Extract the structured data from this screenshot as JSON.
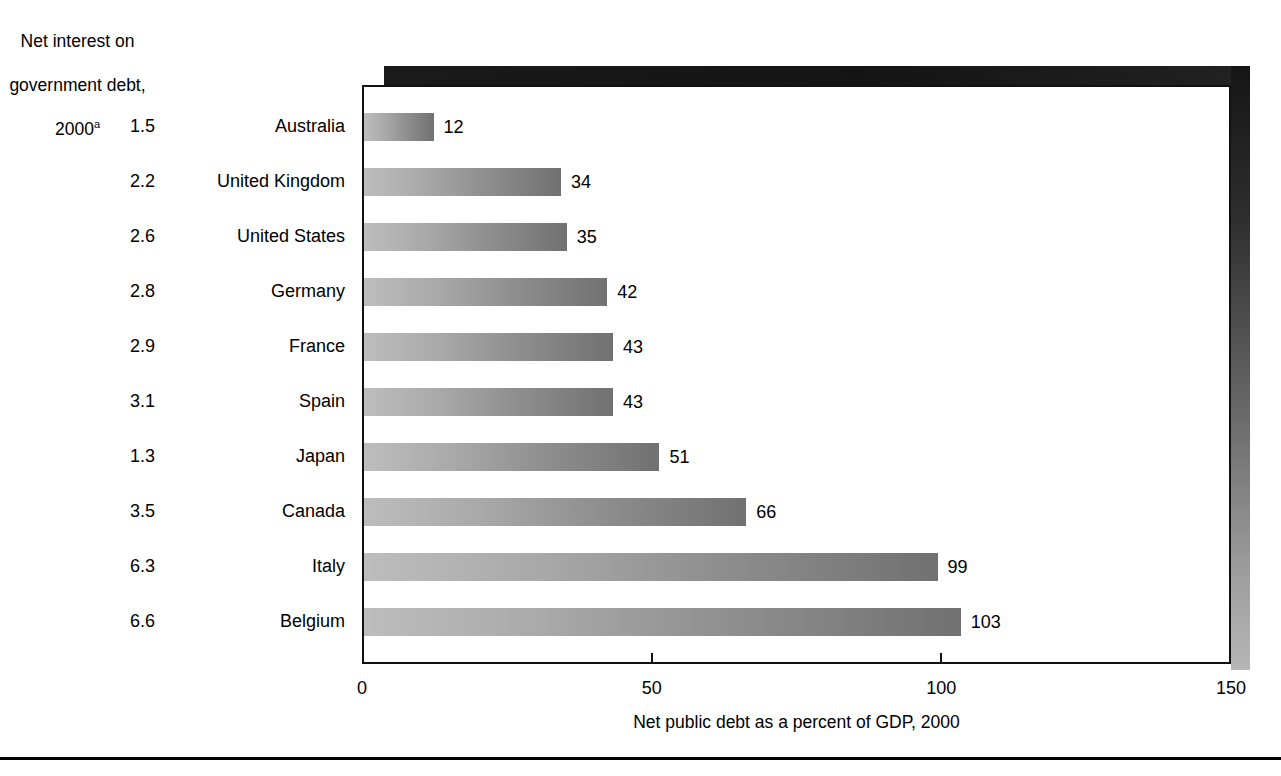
{
  "row_header": {
    "line1": "Net interest on",
    "line2": "government debt,",
    "line3": "2000",
    "footnote_marker": "a"
  },
  "axis": {
    "x_title": "Net public debt as a percent of GDP, 2000",
    "ticks": [
      "0",
      "50",
      "100",
      "150"
    ]
  },
  "rows": [
    {
      "interest": "1.5",
      "country": "Australia",
      "value": "12",
      "debt": 12
    },
    {
      "interest": "2.2",
      "country": "United Kingdom",
      "value": "34",
      "debt": 34
    },
    {
      "interest": "2.6",
      "country": "United States",
      "value": "35",
      "debt": 35
    },
    {
      "interest": "2.8",
      "country": "Germany",
      "value": "42",
      "debt": 42
    },
    {
      "interest": "2.9",
      "country": "France",
      "value": "43",
      "debt": 43
    },
    {
      "interest": "3.1",
      "country": "Spain",
      "value": "43",
      "debt": 43
    },
    {
      "interest": "1.3",
      "country": "Japan",
      "value": "51",
      "debt": 51
    },
    {
      "interest": "3.5",
      "country": "Canada",
      "value": "66",
      "debt": 66
    },
    {
      "interest": "6.3",
      "country": "Italy",
      "value": "99",
      "debt": 99
    },
    {
      "interest": "6.6",
      "country": "Belgium",
      "value": "103",
      "debt": 103
    }
  ],
  "colors": {
    "bar_light": "#bdbdbd",
    "bar_dark": "#717171",
    "frame": "#111111",
    "text": "#000000",
    "background": "#ffffff"
  },
  "chart_data": {
    "type": "bar",
    "orientation": "horizontal",
    "title": "",
    "xlabel": "Net public debt as a percent of GDP, 2000",
    "ylabel": "",
    "categories": [
      "Australia",
      "United Kingdom",
      "United States",
      "Germany",
      "France",
      "Spain",
      "Japan",
      "Canada",
      "Italy",
      "Belgium"
    ],
    "values": [
      12,
      34,
      35,
      42,
      43,
      43,
      51,
      66,
      99,
      103
    ],
    "data_labels": [
      "12",
      "34",
      "35",
      "42",
      "43",
      "43",
      "51",
      "66",
      "99",
      "103"
    ],
    "xlim": [
      0,
      150
    ],
    "xticks": [
      0,
      50,
      100,
      150
    ],
    "xtick_labels": [
      "0",
      "50",
      "100",
      "150"
    ],
    "grid": false,
    "legend": false,
    "series": [
      {
        "name": "Net public debt as a percent of GDP, 2000",
        "values": [
          12,
          34,
          35,
          42,
          43,
          43,
          51,
          66,
          99,
          103
        ]
      },
      {
        "name": "Net interest on government debt, 2000",
        "values": [
          1.5,
          2.2,
          2.6,
          2.8,
          2.9,
          3.1,
          1.3,
          3.5,
          6.3,
          6.6
        ],
        "rendered_as": "row-label-column"
      }
    ],
    "annotations": [
      "a"
    ]
  }
}
